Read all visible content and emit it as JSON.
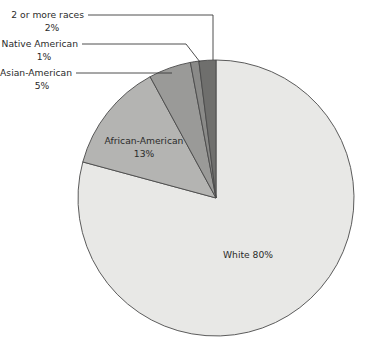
{
  "chart_data": {
    "type": "pie",
    "title": "",
    "subtitle": "",
    "xlabel": "",
    "ylabel": "",
    "legend_position": "none",
    "grid": false,
    "total_percent": 101,
    "start_angle_deg": 0,
    "direction": "counterclockwise",
    "categories": [
      "White",
      "African-American",
      "Asian-American",
      "Native American",
      "2 or more races"
    ],
    "values": [
      80,
      13,
      5,
      1,
      2
    ],
    "slice_colors": [
      "#e8e8e6",
      "#b4b4b2",
      "#9a9a98",
      "#8a8a88",
      "#6f6f6d"
    ],
    "slices": [
      {
        "name": "2 or more races",
        "label": "2 or more races",
        "percent_label": "2%",
        "value": 2,
        "color": "#6f6f6d",
        "label_placement": "outside-left-with-leader"
      },
      {
        "name": "Native American",
        "label": "Native American",
        "percent_label": "1%",
        "value": 1,
        "color": "#8a8a88",
        "label_placement": "outside-left-with-leader"
      },
      {
        "name": "Asian-American",
        "label": "Asian-American",
        "percent_label": "5%",
        "value": 5,
        "color": "#9a9a98",
        "label_placement": "outside-left-with-leader"
      },
      {
        "name": "African-American",
        "label": "African-American",
        "percent_label": "13%",
        "value": 13,
        "color": "#b4b4b2",
        "label_placement": "inside"
      },
      {
        "name": "White",
        "label": "White 80%",
        "percent_label": "80%",
        "value": 80,
        "color": "#e8e8e6",
        "label_placement": "inside"
      }
    ]
  },
  "labels": {
    "two_or_more_name": "2 or more races",
    "two_or_more_pct": "2%",
    "native_american_name": "Native American",
    "native_american_pct": "1%",
    "asian_american_name": "Asian-American",
    "asian_american_pct": "5%",
    "african_american_name": "African-American",
    "african_american_pct": "13%",
    "white_inline": "White 80%"
  },
  "colors": {
    "background": "#ffffff",
    "text": "#2b2b2b",
    "outline": "#4a4a4a",
    "leader_line": "#3a3a3a",
    "white_slice": "#e8e8e6",
    "african_american_slice": "#b4b4b2",
    "asian_american_slice": "#9a9a98",
    "native_american_slice": "#8a8a88",
    "two_or_more_slice": "#6f6f6d"
  }
}
